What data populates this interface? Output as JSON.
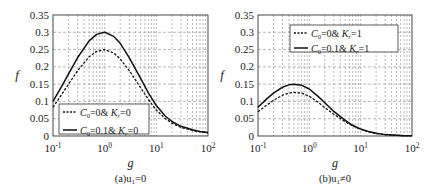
{
  "chart_data": [
    {
      "type": "line",
      "panel": "a",
      "caption": "(a)u₁=0",
      "caption_main": "(a)u",
      "caption_sub": "1",
      "caption_tail": "=0",
      "xlabel": "g",
      "ylabel": "f",
      "xscale": "log",
      "xlim": [
        0.1,
        100
      ],
      "ylim": [
        0,
        0.35
      ],
      "grid": true,
      "x_ticks": [
        {
          "base": "10",
          "exp": "-1",
          "value": 0.1
        },
        {
          "base": "10",
          "exp": "0",
          "value": 1
        },
        {
          "base": "10",
          "exp": "1",
          "value": 10
        },
        {
          "base": "10",
          "exp": "2",
          "value": 100
        }
      ],
      "y_ticks": [
        "0",
        "0.05",
        "0.1",
        "0.15",
        "0.2",
        "0.25",
        "0.3",
        "0.35"
      ],
      "y_tick_values": [
        0,
        0.05,
        0.1,
        0.15,
        0.2,
        0.25,
        0.3,
        0.35
      ],
      "legend_position": "lower left",
      "x": [
        0.1,
        0.15,
        0.2,
        0.3,
        0.5,
        0.7,
        1,
        1.5,
        2,
        3,
        5,
        7,
        10,
        15,
        20,
        30,
        50,
        70,
        100
      ],
      "series": [
        {
          "name": "C0=0& Kr=0",
          "label_parts": [
            "C",
            "0",
            "=0& K",
            "r",
            "=0"
          ],
          "style": "dotted",
          "values": [
            0.083,
            0.122,
            0.15,
            0.189,
            0.229,
            0.245,
            0.25,
            0.24,
            0.223,
            0.189,
            0.139,
            0.106,
            0.075,
            0.05,
            0.037,
            0.025,
            0.016,
            0.012,
            0.009
          ]
        },
        {
          "name": "C0=0.1& Kr=0",
          "label_parts": [
            "C",
            "0",
            "=0.1& K",
            "r",
            "=0"
          ],
          "style": "solid",
          "values": [
            0.1,
            0.146,
            0.18,
            0.227,
            0.275,
            0.294,
            0.3,
            0.288,
            0.268,
            0.226,
            0.166,
            0.125,
            0.088,
            0.057,
            0.042,
            0.028,
            0.018,
            0.013,
            0.01
          ]
        }
      ]
    },
    {
      "type": "line",
      "panel": "b",
      "caption": "(b)u₁≠0",
      "caption_main": "(b)u",
      "caption_sub": "1",
      "caption_tail": "≠0",
      "xlabel": "g",
      "ylabel": "f",
      "xscale": "log",
      "xlim": [
        0.1,
        100
      ],
      "ylim": [
        0,
        0.35
      ],
      "grid": true,
      "x_ticks": [
        {
          "base": "10",
          "exp": "-1",
          "value": 0.1
        },
        {
          "base": "10",
          "exp": "0",
          "value": 1
        },
        {
          "base": "10",
          "exp": "1",
          "value": 10
        },
        {
          "base": "10",
          "exp": "2",
          "value": 100
        }
      ],
      "y_ticks": [
        "0",
        "0.05",
        "0.1",
        "0.15",
        "0.2",
        "0.25",
        "0.3",
        "0.35"
      ],
      "y_tick_values": [
        0,
        0.05,
        0.1,
        0.15,
        0.2,
        0.25,
        0.3,
        0.35
      ],
      "legend_position": "upper right",
      "x": [
        0.1,
        0.15,
        0.2,
        0.3,
        0.4,
        0.5,
        0.7,
        1,
        1.5,
        2,
        3,
        5,
        7,
        10,
        15,
        20,
        30,
        50,
        70,
        100
      ],
      "series": [
        {
          "name": "C0=0& Kr=1",
          "label_parts": [
            "C",
            "0",
            "=0& K",
            "r",
            "=1"
          ],
          "style": "dotted",
          "values": [
            0.07,
            0.09,
            0.103,
            0.118,
            0.124,
            0.126,
            0.124,
            0.115,
            0.097,
            0.082,
            0.063,
            0.041,
            0.029,
            0.019,
            0.011,
            0.007,
            0.004,
            0.002,
            0.001,
            0.001
          ]
        },
        {
          "name": "C0=0.1& Kr=1",
          "label_parts": [
            "C",
            "0",
            "=0.1& K",
            "r",
            "=1"
          ],
          "style": "solid",
          "values": [
            0.083,
            0.108,
            0.124,
            0.141,
            0.148,
            0.15,
            0.147,
            0.136,
            0.114,
            0.096,
            0.071,
            0.045,
            0.031,
            0.02,
            0.012,
            0.008,
            0.004,
            0.002,
            0.001,
            0.001
          ]
        }
      ]
    }
  ]
}
